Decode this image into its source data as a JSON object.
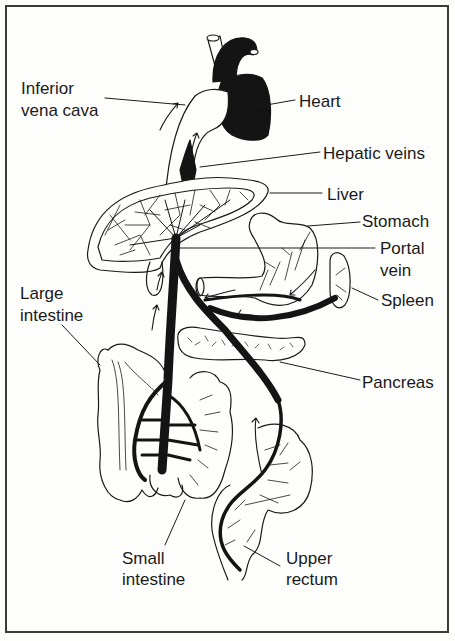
{
  "diagram": {
    "labels": {
      "inferior_vena_cava": [
        "Inferior",
        "vena cava"
      ],
      "heart": "Heart",
      "hepatic_veins": "Hepatic veins",
      "liver": "Liver",
      "stomach": "Stomach",
      "portal_vein": [
        "Portal",
        "vein"
      ],
      "spleen": "Spleen",
      "large_intestine": [
        "Large",
        "intestine"
      ],
      "pancreas": "Pancreas",
      "small_intestine": [
        "Small",
        "intestine"
      ],
      "upper_rectum": [
        "Upper",
        "rectum"
      ]
    },
    "colors": {
      "ink": "#1a1a1a",
      "vessel": "#141414",
      "paper": "#fefefc",
      "border": "#3a3a3a"
    }
  }
}
